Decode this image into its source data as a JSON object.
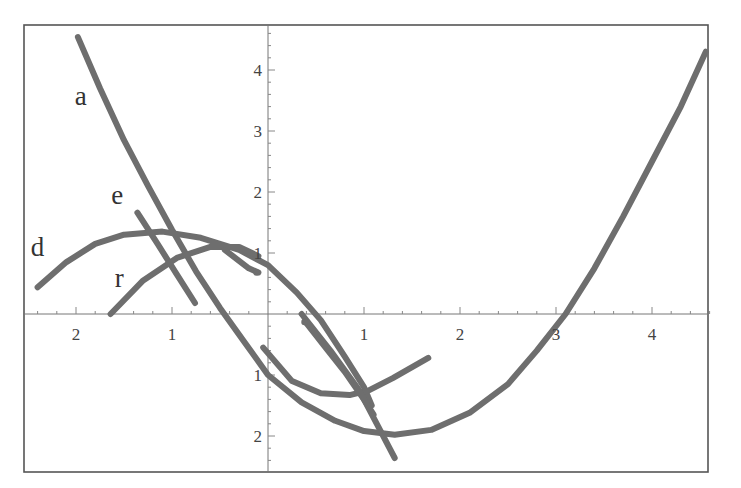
{
  "chart_data": {
    "type": "line",
    "title": "",
    "xlabel": "",
    "ylabel": "",
    "xlim": [
      -2.55,
      4.7
    ],
    "ylim": [
      -2.6,
      4.75
    ],
    "grid": false,
    "legend": "none (curves labeled inline)",
    "x_tick_labels": [
      {
        "value": -2,
        "label": "2"
      },
      {
        "value": -1,
        "label": "1"
      },
      {
        "value": 1,
        "label": "1"
      },
      {
        "value": 2,
        "label": "2"
      },
      {
        "value": 3,
        "label": "3"
      },
      {
        "value": 4,
        "label": "4"
      }
    ],
    "y_tick_labels": [
      {
        "value": 4,
        "label": "4"
      },
      {
        "value": 3,
        "label": "3"
      },
      {
        "value": 2,
        "label": "2"
      },
      {
        "value": 1,
        "label": "1"
      },
      {
        "value": -1,
        "label": "1"
      },
      {
        "value": -2,
        "label": "2"
      }
    ],
    "annotations": [
      {
        "text": "a",
        "x": -1.95,
        "y": 3.42
      },
      {
        "text": "e",
        "x": -1.57,
        "y": 1.8
      },
      {
        "text": "d",
        "x": -2.4,
        "y": 0.95
      },
      {
        "text": "r",
        "x": -1.55,
        "y": 0.45
      }
    ],
    "series": [
      {
        "name": "a",
        "points": [
          [
            -1.98,
            4.54
          ],
          [
            -1.75,
            3.7
          ],
          [
            -1.5,
            2.85
          ],
          [
            -1.25,
            2.1
          ],
          [
            -1.0,
            1.38
          ],
          [
            -0.75,
            0.7
          ],
          [
            -0.5,
            0.1
          ],
          [
            -0.25,
            -0.45
          ],
          [
            0.0,
            -1.0
          ],
          [
            0.35,
            -1.45
          ],
          [
            0.7,
            -1.75
          ],
          [
            1.0,
            -1.92
          ],
          [
            1.32,
            -1.98
          ],
          [
            1.7,
            -1.9
          ],
          [
            2.1,
            -1.62
          ],
          [
            2.5,
            -1.15
          ],
          [
            2.8,
            -0.6
          ],
          [
            3.1,
            0.0
          ],
          [
            3.4,
            0.75
          ],
          [
            3.7,
            1.6
          ],
          [
            4.0,
            2.5
          ],
          [
            4.3,
            3.4
          ],
          [
            4.56,
            4.3
          ]
        ]
      },
      {
        "name": "d",
        "points": [
          [
            -2.4,
            0.44
          ],
          [
            -2.1,
            0.85
          ],
          [
            -1.8,
            1.15
          ],
          [
            -1.5,
            1.3
          ],
          [
            -1.1,
            1.35
          ],
          [
            -0.7,
            1.25
          ],
          [
            -0.3,
            1.05
          ],
          [
            0.0,
            0.8
          ],
          [
            0.3,
            0.35
          ],
          [
            0.55,
            -0.1
          ],
          [
            0.8,
            -0.7
          ],
          [
            1.0,
            -1.2
          ],
          [
            1.08,
            -1.5
          ]
        ]
      },
      {
        "name": "e",
        "points": [
          [
            -1.36,
            1.66
          ],
          [
            -1.15,
            1.15
          ],
          [
            -0.95,
            0.65
          ],
          [
            -0.76,
            0.18
          ]
        ]
      },
      {
        "name": "r",
        "points": [
          [
            -1.64,
            0.0
          ],
          [
            -1.3,
            0.55
          ],
          [
            -0.95,
            0.92
          ],
          [
            -0.6,
            1.1
          ],
          [
            -0.3,
            1.1
          ],
          [
            -0.1,
            0.95
          ]
        ]
      },
      {
        "name": "r_lower",
        "points": [
          [
            -0.05,
            -0.55
          ],
          [
            0.25,
            -1.1
          ],
          [
            0.55,
            -1.3
          ],
          [
            0.85,
            -1.33
          ],
          [
            1.05,
            -1.25
          ],
          [
            1.3,
            -1.05
          ],
          [
            1.67,
            -0.72
          ]
        ]
      },
      {
        "name": "segment_inner",
        "points": [
          [
            -0.45,
            1.05
          ],
          [
            -0.2,
            0.75
          ],
          [
            -0.1,
            0.68
          ]
        ]
      },
      {
        "name": "segment_steep_1",
        "points": [
          [
            0.4,
            -0.15
          ],
          [
            0.6,
            -0.55
          ],
          [
            0.8,
            -0.95
          ],
          [
            1.02,
            -1.45
          ],
          [
            1.1,
            -1.65
          ]
        ]
      },
      {
        "name": "segment_steep_2",
        "points": [
          [
            0.35,
            -0.0
          ],
          [
            0.65,
            -0.6
          ],
          [
            0.95,
            -1.25
          ],
          [
            1.15,
            -1.85
          ],
          [
            1.32,
            -2.36
          ]
        ]
      }
    ]
  }
}
